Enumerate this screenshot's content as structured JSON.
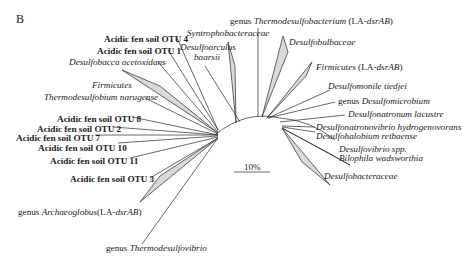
{
  "panel_label": "B",
  "scale_bar": {
    "label": "10%"
  },
  "taxa": {
    "otu4": "Acidic fen soil OTU 4",
    "otu1": "Acidic fen soil OTU 1",
    "desulfobacca": "Desulfobacca acetoxidans",
    "firmicutes_a": "Firmicutes",
    "thermodesulfobium": "Thermodesulfobium narugense",
    "otu8": "Acidic fen soil OTU 8",
    "otu2": "Acidic fen soil OTU 2",
    "otu7": "Acidic fen soil OTU 7",
    "otu10": "Acidic fen soil OTU 10",
    "otu11": "Acidic fen soil OTU 11",
    "otu3": "Acidic fen soil OTU 3",
    "archaeoglobus_prefix": "genus ",
    "archaeoglobus_name": "Archaeoglobus",
    "archaeoglobus_suffix": "(LA-",
    "archaeoglobus_gene": "dsrAB",
    "archaeoglobus_close": ")",
    "thermodesulfovibrio_prefix": "genus ",
    "thermodesulfovibrio_name": "Thermodesulfovibrio",
    "syntrophobacteraceae": "Syntrophobacteraceae",
    "desulfoarculus_1": "Desulfoarculus",
    "desulfoarculus_2": "baarsii",
    "thermodesulfobacterium_prefix": "genus ",
    "thermodesulfobacterium_name": "Thermodesulfobacterium",
    "thermodesulfobacterium_suffix": " (LA-",
    "thermodesulfobacterium_gene": "dsrAB",
    "thermodesulfobacterium_close": ")",
    "desulfobulbaceae": "Desulfobulbaceae",
    "firmicutes_b_name": "Firmicutes",
    "firmicutes_b_suffix": " (LA-",
    "firmicutes_b_gene": "dsrAB",
    "firmicutes_b_close": ")",
    "desulfomonile": "Desulfomonile tiedjei",
    "desulfomicrobium_prefix": "genus ",
    "desulfomicrobium_name": "Desulfomicrobium",
    "desulfonatronum": "Desulfonatronum lacustre",
    "desulfonatronovibrio": "Desulfonatronovibrio hydrogenovorans",
    "desulfohalobium": "Desulfohalobium retbaense",
    "desulfovibrio": "Desulfovibrio spp.",
    "bilophila": "Bilophila wadsworthia",
    "desulfobacteraceae": "Desulfobacteraceae"
  },
  "colors": {
    "line": "#2a2a2a",
    "wedge_fill": "#d9d9d9"
  }
}
